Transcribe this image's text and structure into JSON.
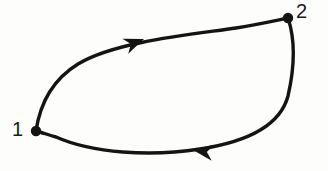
{
  "figure": {
    "kind": "directed-graph-diagram",
    "style": "hand-drawn ink on paper",
    "background_color": "#fdfdfc",
    "ink_color": "#141414",
    "width": 328,
    "height": 171
  },
  "nodes": [
    {
      "id": "1",
      "label": "1",
      "x": 36,
      "y": 131,
      "radius": 5,
      "label_x": 12,
      "label_y": 119
    },
    {
      "id": "2",
      "label": "2",
      "x": 288,
      "y": 18,
      "radius": 5,
      "label_x": 296,
      "label_y": 1
    }
  ],
  "edges": [
    {
      "id": "edge-1-to-2",
      "from": "1",
      "to": "2",
      "direction": "1 → 2",
      "description": "upper arc bulging upward from node 1 to node 2",
      "path": "M 36 131 C 40 104, 52 80, 78 64 C 116 41, 196 34, 236 28 C 260 24, 278 20, 288 18",
      "arrow_tip_x": 144,
      "arrow_tip_y": 39,
      "arrow_angle_deg": -21
    },
    {
      "id": "edge-2-to-1",
      "from": "2",
      "to": "1",
      "direction": "2 → 1",
      "description": "lower arc sweeping down the right side and sagging back to node 1",
      "path": "M 288 18 C 296 42, 294 70, 288 96 C 280 126, 246 142, 200 149 C 150 157, 92 153, 56 137 C 46 134, 40 132, 36 131",
      "arrow_tip_x": 193,
      "arrow_tip_y": 150,
      "arrow_angle_deg": 188
    }
  ],
  "arrowheads": [
    {
      "id": "arrowhead-top",
      "on_edge": "edge-1-to-2",
      "points_toward": "2",
      "points": "0,0 -20,-8 -14,0 -20,8"
    },
    {
      "id": "arrowhead-bottom",
      "on_edge": "edge-2-to-1",
      "points_toward": "1",
      "points": "0,0 -20,-8 -14,0 -20,8"
    }
  ]
}
